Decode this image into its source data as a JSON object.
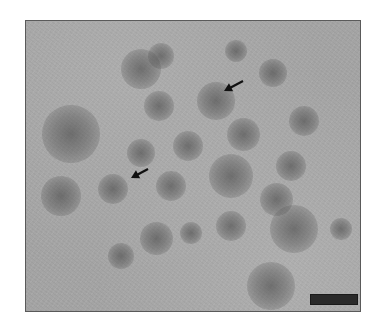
{
  "figure": {
    "type": "electron-micrograph",
    "background_color": "#a4a4a4",
    "frame_border_color": "#5a5a5a",
    "particle_color": "#3c3c3c",
    "ghost_text": "",
    "frame": {
      "left": 25,
      "top": 20,
      "width": 336,
      "height": 292
    },
    "particles": [
      {
        "x": 140,
        "y": 68,
        "r": 18
      },
      {
        "x": 160,
        "y": 55,
        "r": 12
      },
      {
        "x": 235,
        "y": 50,
        "r": 10
      },
      {
        "x": 272,
        "y": 72,
        "r": 13
      },
      {
        "x": 215,
        "y": 100,
        "r": 17
      },
      {
        "x": 158,
        "y": 105,
        "r": 14
      },
      {
        "x": 70,
        "y": 133,
        "r": 26
      },
      {
        "x": 303,
        "y": 120,
        "r": 14
      },
      {
        "x": 242,
        "y": 133,
        "r": 15
      },
      {
        "x": 187,
        "y": 145,
        "r": 14
      },
      {
        "x": 140,
        "y": 152,
        "r": 13
      },
      {
        "x": 290,
        "y": 165,
        "r": 14
      },
      {
        "x": 230,
        "y": 175,
        "r": 20
      },
      {
        "x": 170,
        "y": 185,
        "r": 14
      },
      {
        "x": 112,
        "y": 188,
        "r": 14
      },
      {
        "x": 60,
        "y": 195,
        "r": 18
      },
      {
        "x": 275,
        "y": 198,
        "r": 15
      },
      {
        "x": 230,
        "y": 225,
        "r": 14
      },
      {
        "x": 293,
        "y": 228,
        "r": 22
      },
      {
        "x": 155,
        "y": 237,
        "r": 15
      },
      {
        "x": 190,
        "y": 232,
        "r": 10
      },
      {
        "x": 120,
        "y": 255,
        "r": 12
      },
      {
        "x": 270,
        "y": 285,
        "r": 22
      },
      {
        "x": 340,
        "y": 228,
        "r": 10
      }
    ],
    "arrows": [
      {
        "name": "arrow-upper",
        "tip_x": 223,
        "tip_y": 90,
        "tail_x": 242,
        "tail_y": 80
      },
      {
        "name": "arrow-lower",
        "tip_x": 130,
        "tip_y": 177,
        "tail_x": 147,
        "tail_y": 168
      }
    ],
    "scale_bar": {
      "x": 309,
      "y": 293,
      "width": 48,
      "height": 11,
      "label": ""
    }
  }
}
